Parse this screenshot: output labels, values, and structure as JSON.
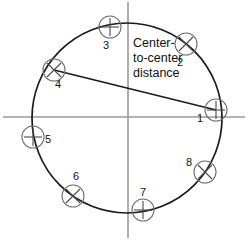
{
  "figure": {
    "title_text": "Center-to-center distance",
    "callout_lines": [
      "Center-",
      "to-center",
      "distance"
    ],
    "stroke_colors": {
      "axis": "#9a9a9a",
      "main_circle": "#1a1a1a",
      "chord": "#1a1a1a",
      "marker_circle": "#6e6e6e",
      "marker_tick": "#4a4a4a",
      "label_text": "#111111",
      "background": "#ffffff"
    },
    "geometry": {
      "center_x": 127,
      "center_y": 118,
      "radius": 95,
      "axis_horizontal_y": 117,
      "axis_vertical_x": 128,
      "marker_radius": 11
    },
    "chord": {
      "from_marker": "4",
      "to_marker": "1",
      "x1": 54,
      "y1": 70,
      "x2": 216,
      "y2": 110
    },
    "markers": [
      {
        "id": "m1",
        "label": "1",
        "cx": 216,
        "cy": 110,
        "tick": "plus",
        "label_x": 200,
        "label_y": 122
      },
      {
        "id": "m2",
        "label": "2",
        "cx": 186,
        "cy": 44,
        "tick": "cross",
        "label_x": 180,
        "label_y": 66
      },
      {
        "id": "m3",
        "label": "3",
        "cx": 110,
        "cy": 27,
        "tick": "plus",
        "label_x": 106,
        "label_y": 49
      },
      {
        "id": "m4",
        "label": "4",
        "cx": 54,
        "cy": 70,
        "tick": "cross",
        "label_x": 58,
        "label_y": 88
      },
      {
        "id": "m5",
        "label": "5",
        "cx": 33,
        "cy": 137,
        "tick": "plus",
        "label_x": 46,
        "label_y": 144
      },
      {
        "id": "m6",
        "label": "6",
        "cx": 73,
        "cy": 196,
        "tick": "cross",
        "label_x": 76,
        "label_y": 181
      },
      {
        "id": "m7",
        "label": "7",
        "cx": 143,
        "cy": 210,
        "tick": "plus",
        "label_x": 143,
        "label_y": 198
      },
      {
        "id": "m8",
        "label": "8",
        "cx": 205,
        "cy": 172,
        "tick": "cross",
        "label_x": 190,
        "label_y": 167
      }
    ]
  }
}
